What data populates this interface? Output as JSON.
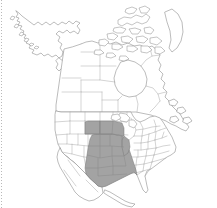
{
  "figure": {
    "title": "North America distribution map",
    "width": 217,
    "height": 208,
    "background_color": "#ffffff",
    "border": {
      "name": "left-dotted-rule",
      "style": "dotted",
      "color": "#b9b9b9",
      "position": "left"
    }
  },
  "legend": {
    "shaded_label": "Range present",
    "unshaded_label": "Range absent",
    "shaded_color": "#a3a3a3",
    "unshaded_color": "#ffffff",
    "boundary_color": "#a8a8a8",
    "coastline_color": "#8f8f8f",
    "visible": false
  },
  "map": {
    "projection": "lambert-conformal-conic",
    "extent_label": "North America",
    "regions": [
      {
        "name": "alaska",
        "shaded": false
      },
      {
        "name": "canada",
        "shaded": false
      },
      {
        "name": "greenland-edge",
        "shaded": false
      },
      {
        "name": "arctic-archipelago",
        "shaded": false
      },
      {
        "name": "contiguous-united-states",
        "shaded": false
      },
      {
        "name": "mexico-northern",
        "shaded": false
      }
    ],
    "shaded_regions": [
      {
        "name": "nebraska",
        "shaded": true
      },
      {
        "name": "iowa",
        "shaded": true
      },
      {
        "name": "kansas",
        "shaded": true
      },
      {
        "name": "missouri",
        "shaded": true
      },
      {
        "name": "colorado-east",
        "shaded": true
      },
      {
        "name": "oklahoma",
        "shaded": true
      },
      {
        "name": "arkansas",
        "shaded": true
      },
      {
        "name": "texas",
        "shaded": true
      },
      {
        "name": "louisiana",
        "shaded": true
      },
      {
        "name": "illinois-southwest",
        "shaded": true
      }
    ]
  },
  "chart_data": {
    "type": "map",
    "title": "North America distribution map",
    "xlabel": "",
    "ylabel": "",
    "categories": [
      "Alaska",
      "Canada",
      "Greenland",
      "Nebraska",
      "Iowa",
      "Kansas",
      "Missouri",
      "Colorado",
      "Oklahoma",
      "Arkansas",
      "Texas",
      "Louisiana",
      "Illinois",
      "California",
      "Florida",
      "Maine"
    ],
    "values": [
      0,
      0,
      0,
      1,
      1,
      1,
      1,
      1,
      1,
      1,
      1,
      1,
      1,
      0,
      0,
      0
    ],
    "value_labels": {
      "0": "absent",
      "1": "present"
    },
    "colors": {
      "present": "#a3a3a3",
      "absent": "#ffffff"
    },
    "legend_position": "none",
    "grid": false
  }
}
